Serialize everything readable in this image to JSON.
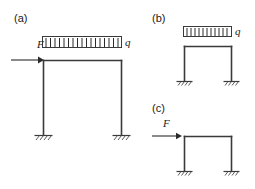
{
  "figure": {
    "background_color": "#ffffff",
    "line_color": "#3a3a3a",
    "text_color": "#1a1a1a"
  },
  "panels": [
    {
      "id": "a",
      "label": "(a)",
      "description": "Portal frame with uniformly distributed load q on top beam and horizontal point load F at top-left joint",
      "has_distributed_load": true,
      "has_point_load": true,
      "distributed_load_label": "q",
      "point_load_label": "F",
      "support_type": "fixed",
      "support_count": 2
    },
    {
      "id": "b",
      "label": "(b)",
      "description": "Portal frame with uniformly distributed load q only",
      "has_distributed_load": true,
      "has_point_load": false,
      "distributed_load_label": "q",
      "point_load_label": "",
      "support_type": "fixed",
      "support_count": 2
    },
    {
      "id": "c",
      "label": "(c)",
      "description": "Portal frame with horizontal point load F only",
      "has_distributed_load": false,
      "has_point_load": true,
      "distributed_load_label": "",
      "point_load_label": "F",
      "support_type": "fixed",
      "support_count": 2
    }
  ],
  "labels": {
    "panel_a": "(a)",
    "panel_b": "(b)",
    "panel_c": "(c)",
    "q_a": "q",
    "q_b": "q",
    "F_a": "F",
    "F_c": "F"
  }
}
